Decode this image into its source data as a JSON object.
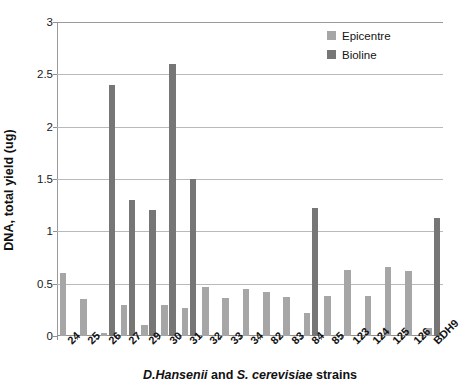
{
  "chart_data": {
    "type": "bar",
    "title": "",
    "xlabel": "D.Hansenii and S. cerevisiae strains",
    "xlabel_parts": {
      "species_1": "D.Hansenii",
      "conjunction": " and ",
      "species_2": "S. cerevisiae",
      "suffix": " strains"
    },
    "ylabel": "DNA, total yield (ug)",
    "ylim": [
      0,
      3
    ],
    "ytick_labels": [
      "0",
      "0.5",
      "1",
      "1.5",
      "2",
      "2.5",
      "3"
    ],
    "ytick_values": [
      0,
      0.5,
      1,
      1.5,
      2,
      2.5,
      3
    ],
    "grid": true,
    "legend_position": "top-right",
    "categories": [
      "24",
      "25",
      "26",
      "27",
      "29",
      "30",
      "31",
      "32",
      "33",
      "34",
      "82",
      "83",
      "84",
      "85",
      "123",
      "124",
      "125",
      "126",
      "BDH9"
    ],
    "series": [
      {
        "name": "Epicentre",
        "color": "#a6a6a6",
        "values": [
          0.6,
          0.35,
          0.03,
          0.3,
          0.11,
          0.3,
          0.27,
          0.47,
          0.36,
          0.45,
          0.42,
          0.37,
          0.22,
          0.38,
          0.63,
          0.38,
          0.66,
          0.62,
          0.08
        ]
      },
      {
        "name": "Bioline",
        "color": "#767676",
        "values": [
          0,
          0,
          2.4,
          1.3,
          1.2,
          2.6,
          1.5,
          0,
          0,
          0,
          0,
          0,
          1.22,
          0,
          0,
          0,
          0,
          0,
          1.13
        ]
      }
    ]
  },
  "legend": {
    "items": [
      {
        "label": "Epicentre",
        "swatch": "epicentre"
      },
      {
        "label": "Bioline",
        "swatch": "bioline"
      }
    ]
  }
}
